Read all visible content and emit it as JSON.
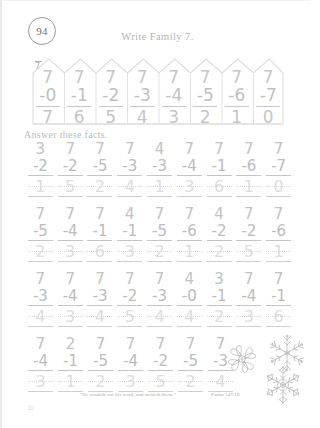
{
  "lesson": {
    "number": "94"
  },
  "header": {
    "title": "Write Family 7."
  },
  "fence": {
    "key_label": "7",
    "columns": [
      {
        "minuend": "7",
        "subtrahend": "-0",
        "answer": "7"
      },
      {
        "minuend": "7",
        "subtrahend": "-1",
        "answer": "6"
      },
      {
        "minuend": "7",
        "subtrahend": "-2",
        "answer": "5"
      },
      {
        "minuend": "7",
        "subtrahend": "-3",
        "answer": "4"
      },
      {
        "minuend": "7",
        "subtrahend": "-4",
        "answer": "3"
      },
      {
        "minuend": "7",
        "subtrahend": "-5",
        "answer": "2"
      },
      {
        "minuend": "7",
        "subtrahend": "-6",
        "answer": "1"
      },
      {
        "minuend": "7",
        "subtrahend": "-7",
        "answer": "0"
      }
    ]
  },
  "instruction": {
    "text": "Answer these facts."
  },
  "rows": [
    {
      "problems": [
        {
          "minuend": "3",
          "subtrahend": "-2",
          "answer": "1"
        },
        {
          "minuend": "7",
          "subtrahend": "-2",
          "answer": "5"
        },
        {
          "minuend": "7",
          "subtrahend": "-5",
          "answer": "2"
        },
        {
          "minuend": "7",
          "subtrahend": "-3",
          "answer": "4"
        },
        {
          "minuend": "4",
          "subtrahend": "-3",
          "answer": "1"
        },
        {
          "minuend": "7",
          "subtrahend": "-4",
          "answer": "3"
        },
        {
          "minuend": "7",
          "subtrahend": "-1",
          "answer": "6"
        },
        {
          "minuend": "7",
          "subtrahend": "-6",
          "answer": "1"
        },
        {
          "minuend": "7",
          "subtrahend": "-7",
          "answer": "0"
        }
      ]
    },
    {
      "problems": [
        {
          "minuend": "7",
          "subtrahend": "-5",
          "answer": "2"
        },
        {
          "minuend": "7",
          "subtrahend": "-4",
          "answer": "3"
        },
        {
          "minuend": "7",
          "subtrahend": "-1",
          "answer": "6"
        },
        {
          "minuend": "4",
          "subtrahend": "-1",
          "answer": "3"
        },
        {
          "minuend": "7",
          "subtrahend": "-5",
          "answer": "2"
        },
        {
          "minuend": "7",
          "subtrahend": "-6",
          "answer": "1"
        },
        {
          "minuend": "4",
          "subtrahend": "-2",
          "answer": "2"
        },
        {
          "minuend": "7",
          "subtrahend": "-2",
          "answer": "5"
        },
        {
          "minuend": "7",
          "subtrahend": "-6",
          "answer": "1"
        }
      ]
    },
    {
      "problems": [
        {
          "minuend": "7",
          "subtrahend": "-3",
          "answer": "4"
        },
        {
          "minuend": "7",
          "subtrahend": "-4",
          "answer": "3"
        },
        {
          "minuend": "7",
          "subtrahend": "-3",
          "answer": "4"
        },
        {
          "minuend": "7",
          "subtrahend": "-2",
          "answer": "5"
        },
        {
          "minuend": "7",
          "subtrahend": "-3",
          "answer": "4"
        },
        {
          "minuend": "4",
          "subtrahend": "-0",
          "answer": "4"
        },
        {
          "minuend": "3",
          "subtrahend": "-1",
          "answer": "2"
        },
        {
          "minuend": "7",
          "subtrahend": "-4",
          "answer": "3"
        },
        {
          "minuend": "7",
          "subtrahend": "-1",
          "answer": "6"
        }
      ]
    },
    {
      "problems": [
        {
          "minuend": "7",
          "subtrahend": "-4",
          "answer": "3"
        },
        {
          "minuend": "2",
          "subtrahend": "-1",
          "answer": "1"
        },
        {
          "minuend": "7",
          "subtrahend": "-5",
          "answer": "2"
        },
        {
          "minuend": "7",
          "subtrahend": "-4",
          "answer": "3"
        },
        {
          "minuend": "7",
          "subtrahend": "-2",
          "answer": "5"
        },
        {
          "minuend": "7",
          "subtrahend": "-5",
          "answer": "2"
        },
        {
          "minuend": "7",
          "subtrahend": "-3",
          "answer": "4"
        }
      ]
    }
  ],
  "footer": {
    "verse_text": "“He sendeth out his word, and melteth them.”",
    "verse_reference": "Psalm 147:18",
    "page_number": "22"
  },
  "decorations": {
    "snowflake_large": "snowflake-icon",
    "snowflake_top_right": "snowflake-icon",
    "snowflake_bottom_right": "snowflake-icon"
  },
  "colors": {
    "ink": "#c2c2c2",
    "trace": "#dcdcdc",
    "rule": "#c7c7c7"
  }
}
